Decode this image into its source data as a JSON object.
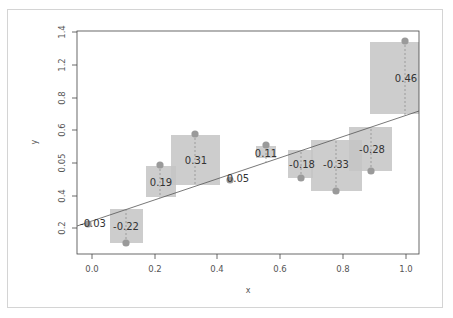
{
  "chart_data": {
    "type": "scatter",
    "title": "",
    "xlabel": "x",
    "ylabel": "y",
    "grid": false,
    "legend": null,
    "xlim": [
      -0.05,
      1.04
    ],
    "ylim": [
      0.1,
      1.4
    ],
    "x_ticks": [
      "0.0",
      "0.2",
      "0.4",
      "0.6",
      "0.8",
      "1.0"
    ],
    "y_ticks": [
      "0.2",
      "0.4",
      "0.05",
      "0.6",
      "0.8",
      "1.2",
      "1.4"
    ],
    "regression_line": {
      "intercept": 0.22,
      "slope": 0.5,
      "color": "#555555"
    },
    "points": [
      {
        "x": 0.0,
        "y": 0.22,
        "fitted": 0.25,
        "residual_label": "-0.03"
      },
      {
        "x": 0.11,
        "y": 0.09,
        "fitted": 0.31,
        "residual_label": "-0.22"
      },
      {
        "x": 0.22,
        "y": 0.55,
        "fitted": 0.36,
        "residual_label": "0.19"
      },
      {
        "x": 0.33,
        "y": 0.73,
        "fitted": 0.42,
        "residual_label": "0.31"
      },
      {
        "x": 0.44,
        "y": 0.52,
        "fitted": 0.47,
        "residual_label": "0.05"
      },
      {
        "x": 0.56,
        "y": 0.64,
        "fitted": 0.53,
        "residual_label": "0.11"
      },
      {
        "x": 0.67,
        "y": 0.4,
        "fitted": 0.58,
        "residual_label": "-0.18"
      },
      {
        "x": 0.78,
        "y": 0.31,
        "fitted": 0.64,
        "residual_label": "-0.33"
      },
      {
        "x": 0.89,
        "y": 0.41,
        "fitted": 0.69,
        "residual_label": "-0.28"
      },
      {
        "x": 1.0,
        "y": 1.21,
        "fitted": 0.75,
        "residual_label": "0.46"
      }
    ],
    "colors": {
      "box": "#c4c4c4",
      "point": "#9a9a9a",
      "line": "#555555",
      "text": "#333333"
    }
  },
  "render": {
    "plot_box": {
      "left": 77,
      "top": 31,
      "right": 419,
      "bottom": 254
    },
    "x_tick_px": [
      92,
      155,
      217,
      280,
      343,
      406
    ],
    "y_tick_px": [
      228,
      196,
      163,
      130,
      98,
      65,
      32
    ],
    "line_px": {
      "x1": 77,
      "y1": 226,
      "x2": 419,
      "y2": 111
    },
    "points_px": [
      {
        "cx": 88,
        "cy": 224,
        "box": null,
        "label_x": 93,
        "label_y": 227
      },
      {
        "cx": 126,
        "cy": 243,
        "box": [
          110,
          209,
          33,
          34
        ],
        "label_x": 126,
        "label_y": 230
      },
      {
        "cx": 160,
        "cy": 165,
        "box": [
          146,
          166,
          30,
          31
        ],
        "label_x": 161,
        "label_y": 186
      },
      {
        "cx": 195,
        "cy": 134,
        "box": [
          171,
          135,
          49,
          50
        ],
        "label_x": 196,
        "label_y": 164
      },
      {
        "cx": 230,
        "cy": 180,
        "box": null,
        "label_x": 238,
        "label_y": 182
      },
      {
        "cx": 266,
        "cy": 145,
        "box": [
          256,
          146,
          20,
          12
        ],
        "label_x": 266,
        "label_y": 157
      },
      {
        "cx": 301,
        "cy": 178,
        "box": [
          288,
          150,
          25,
          28
        ],
        "label_x": 302,
        "label_y": 168
      },
      {
        "cx": 336,
        "cy": 191,
        "box": [
          311,
          140,
          51,
          51
        ],
        "label_x": 336,
        "label_y": 168
      },
      {
        "cx": 371,
        "cy": 171,
        "box": [
          349,
          127,
          43,
          44
        ],
        "label_x": 372,
        "label_y": 153
      },
      {
        "cx": 405,
        "cy": 41,
        "box": [
          370,
          42,
          49,
          72
        ],
        "label_x": 406,
        "label_y": 82
      }
    ]
  }
}
